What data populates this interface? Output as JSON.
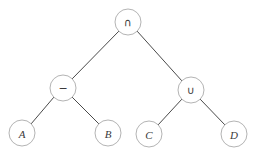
{
  "diagram": {
    "type": "binary-expression-tree",
    "title": "",
    "background_color": "#ffffff",
    "node_fill": "#ffffff",
    "node_stroke": "#b4b4b4",
    "edge_color": "#4a4a4a",
    "label_color": "#3a3a3a",
    "node_radius": 13,
    "nodes": [
      {
        "id": "root",
        "label": "∩",
        "kind": "operator",
        "name": "intersection",
        "cx": 128,
        "cy": 22
      },
      {
        "id": "left",
        "label": "−",
        "kind": "operator",
        "name": "difference",
        "cx": 63,
        "cy": 88
      },
      {
        "id": "right",
        "label": "∪",
        "kind": "operator",
        "name": "union",
        "cx": 191,
        "cy": 90
      },
      {
        "id": "leafA",
        "label": "A",
        "kind": "leaf",
        "name": "set-a",
        "cx": 22,
        "cy": 133
      },
      {
        "id": "leafB",
        "label": "B",
        "kind": "leaf",
        "name": "set-b",
        "cx": 108,
        "cy": 133
      },
      {
        "id": "leafC",
        "label": "C",
        "kind": "leaf",
        "name": "set-c",
        "cx": 149,
        "cy": 134
      },
      {
        "id": "leafD",
        "label": "D",
        "kind": "leaf",
        "name": "set-d",
        "cx": 234,
        "cy": 134
      }
    ],
    "edges": [
      {
        "from": "root",
        "to": "left",
        "x1": 119,
        "y1": 31,
        "x2": 72,
        "y2": 79
      },
      {
        "from": "root",
        "to": "right",
        "x1": 137,
        "y1": 31,
        "x2": 182,
        "y2": 81
      },
      {
        "from": "left",
        "to": "leafA",
        "x1": 54,
        "y1": 97,
        "x2": 31,
        "y2": 124
      },
      {
        "from": "left",
        "to": "leafB",
        "x1": 72,
        "y1": 97,
        "x2": 99,
        "y2": 124
      },
      {
        "from": "right",
        "to": "leafC",
        "x1": 182,
        "y1": 99,
        "x2": 158,
        "y2": 125
      },
      {
        "from": "right",
        "to": "leafD",
        "x1": 200,
        "y1": 99,
        "x2": 225,
        "y2": 125
      }
    ]
  }
}
